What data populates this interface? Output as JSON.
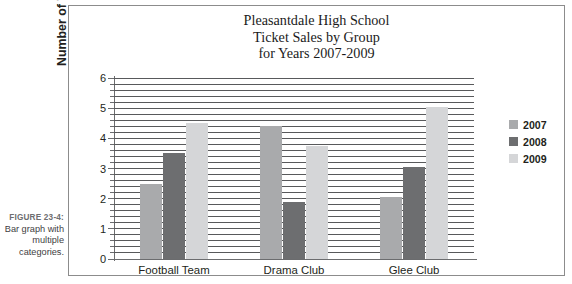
{
  "caption": {
    "figure_number": "FIGURE 23-4:",
    "text": "Bar graph with multiple categories."
  },
  "chart_data": {
    "type": "bar",
    "title": "Pleasantdale High School Ticket Sales by Group for Years 2007-2009",
    "title_lines": [
      "Pleasantdale High School",
      "Ticket Sales by Group",
      "for Years 2007-2009"
    ],
    "xlabel": "",
    "ylabel": "Number of Tickets in Thousands",
    "categories": [
      "Football Team",
      "Drama Club",
      "Glee Club"
    ],
    "series": [
      {
        "name": "2007",
        "color": "#a9aaac",
        "values": [
          2.5,
          4.4,
          2.05
        ]
      },
      {
        "name": "2008",
        "color": "#6d6e70",
        "values": [
          3.5,
          1.9,
          3.05
        ]
      },
      {
        "name": "2009",
        "color": "#d5d6d8",
        "values": [
          4.5,
          3.75,
          5.05
        ]
      }
    ],
    "ylim": [
      0,
      6
    ],
    "ytick_labels": [
      "0",
      "1",
      "2",
      "3",
      "4",
      "5",
      "6"
    ],
    "ytick_values": [
      0,
      1,
      2,
      3,
      4,
      5,
      6
    ],
    "minor_tick_step": 0.2,
    "grid": true,
    "grid_axis": "y",
    "grid_step": 0.2,
    "legend_position": "right"
  }
}
